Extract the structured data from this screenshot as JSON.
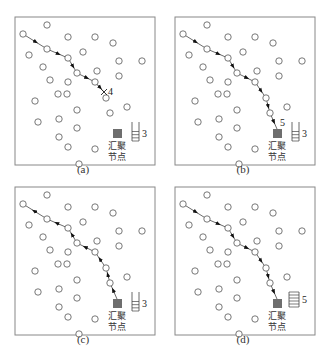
{
  "figure": {
    "panels": [
      {
        "id": "a",
        "caption": "(a)",
        "offset": [
          0,
          0
        ],
        "sink_label_1": "汇聚",
        "sink_label_2": "节点",
        "buffer_count": 3,
        "buffer_slots": 3,
        "path_label": "4",
        "path_end": "cross",
        "direction": "forward",
        "path": [
          [
            23,
            34
          ],
          [
            47,
            49
          ],
          [
            68,
            58
          ],
          [
            77,
            73
          ],
          [
            95,
            82
          ],
          [
            104,
            92
          ]
        ]
      },
      {
        "id": "b",
        "caption": "(b)",
        "offset": [
          160,
          0
        ],
        "sink_label_1": "汇聚",
        "sink_label_2": "节点",
        "buffer_count": 3,
        "buffer_slots": 3,
        "path_label": "5",
        "path_end": "sink",
        "direction": "forward",
        "path": [
          [
            23,
            34
          ],
          [
            47,
            49
          ],
          [
            68,
            58
          ],
          [
            77,
            73
          ],
          [
            95,
            82
          ],
          [
            106,
            98
          ],
          [
            110,
            113
          ],
          [
            117,
            129
          ]
        ]
      },
      {
        "id": "c",
        "caption": "(c)",
        "offset": [
          0,
          170
        ],
        "sink_label_1": "汇聚",
        "sink_label_2": "节点",
        "buffer_count": 3,
        "buffer_slots": 3,
        "path_label": "",
        "path_end": "start",
        "direction": "reverse",
        "path": [
          [
            23,
            34
          ],
          [
            47,
            49
          ],
          [
            68,
            58
          ],
          [
            77,
            73
          ],
          [
            95,
            82
          ],
          [
            106,
            98
          ],
          [
            110,
            113
          ],
          [
            117,
            129
          ]
        ]
      },
      {
        "id": "d",
        "caption": "(d)",
        "offset": [
          160,
          170
        ],
        "sink_label_1": "汇聚",
        "sink_label_2": "节点",
        "buffer_count": 5,
        "buffer_slots": 5,
        "path_label": "",
        "path_end": "sink",
        "direction": "forward",
        "path": [
          [
            23,
            34
          ],
          [
            47,
            49
          ],
          [
            68,
            58
          ],
          [
            77,
            73
          ],
          [
            95,
            82
          ],
          [
            106,
            98
          ],
          [
            110,
            113
          ],
          [
            117,
            129
          ]
        ]
      }
    ],
    "nodes": [
      [
        47,
        25
      ],
      [
        23,
        34
      ],
      [
        68,
        37
      ],
      [
        95,
        37
      ],
      [
        113,
        43
      ],
      [
        47,
        49
      ],
      [
        29,
        55
      ],
      [
        68,
        58
      ],
      [
        83,
        52
      ],
      [
        119,
        61
      ],
      [
        142,
        61
      ],
      [
        43,
        67
      ],
      [
        77,
        73
      ],
      [
        97,
        71
      ],
      [
        119,
        76
      ],
      [
        50,
        80
      ],
      [
        68,
        82
      ],
      [
        95,
        82
      ],
      [
        58,
        94
      ],
      [
        67,
        94
      ],
      [
        106,
        98
      ],
      [
        35,
        101
      ],
      [
        77,
        110
      ],
      [
        127,
        107
      ],
      [
        110,
        113
      ],
      [
        38,
        122
      ],
      [
        59,
        119
      ],
      [
        77,
        128
      ],
      [
        59,
        137
      ],
      [
        68,
        147
      ],
      [
        95,
        149
      ],
      [
        79,
        164
      ]
    ],
    "colors": {
      "node_stroke": "#555555",
      "sink_fill": "#6e6e6e",
      "border": "#888888",
      "path": "#444444"
    }
  }
}
